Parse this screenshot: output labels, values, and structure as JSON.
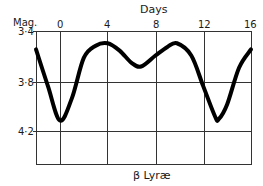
{
  "chart_data": {
    "type": "line",
    "title": "β Lyræ",
    "xlabel": "Days",
    "ylabel": "Mag.",
    "x_ticks": [
      "0",
      "4",
      "8",
      "12",
      "16"
    ],
    "y_ticks": [
      "3·4",
      "3·8",
      "4·2"
    ],
    "xlim": [
      -2,
      16
    ],
    "ylim": [
      3.4,
      4.4
    ],
    "y_inverted": true,
    "grid": true,
    "series": [
      {
        "name": "β Lyræ light curve",
        "x": [
          -2,
          -1,
          0,
          1,
          2,
          3,
          4,
          5,
          6,
          6.8,
          8,
          9,
          9.8,
          11,
          12,
          13,
          13.3,
          14,
          15,
          16
        ],
        "y": [
          3.55,
          3.85,
          4.13,
          3.95,
          3.62,
          3.52,
          3.5,
          3.56,
          3.66,
          3.69,
          3.6,
          3.53,
          3.5,
          3.6,
          3.85,
          4.1,
          4.12,
          4.0,
          3.7,
          3.55
        ]
      }
    ]
  },
  "labels": {
    "x_axis_title": "Days",
    "y_axis_title": "Mag.",
    "caption": "β Lyræ"
  },
  "colors": {
    "curve": "#000000",
    "grid": "#333333",
    "background": "#ffffff"
  }
}
